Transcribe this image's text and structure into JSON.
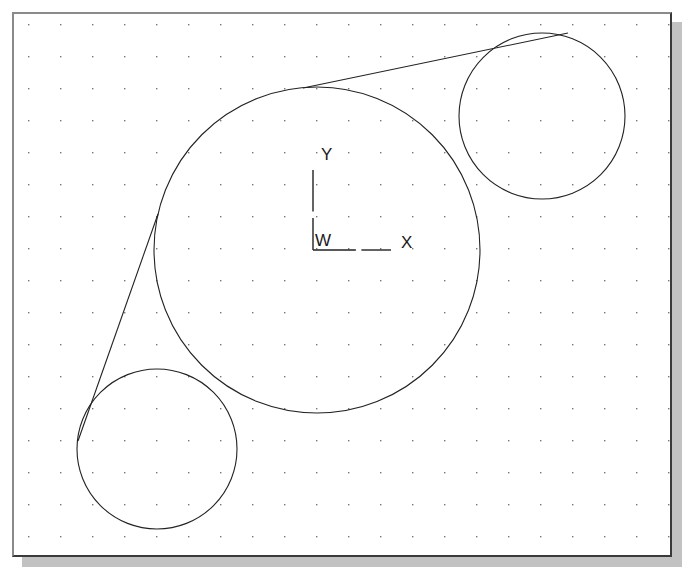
{
  "window": {
    "title": "CAD Drawing Area",
    "background_color": "#ffffff",
    "frame_color": "#3a3a3a",
    "shadow_color": "#9d9d9d"
  },
  "drawing": {
    "name": "tangent-circles-drawing",
    "line_color": "#222222",
    "grid": {
      "name": "dot-grid",
      "visible": true,
      "dot_color": "#777777",
      "spacing_px": 32,
      "origin_x_px": 28,
      "origin_y_px": 24
    },
    "ucs_icon": {
      "name": "ucs-icon",
      "origin_label": "W",
      "x_axis_label": "X",
      "y_axis_label": "Y",
      "origin_x_px": 313,
      "origin_y_px": 250,
      "x_axis_length_px": 78,
      "y_axis_length_px": 80
    },
    "entities": [
      {
        "name": "circle-large-center",
        "type": "circle",
        "cx": 317,
        "cy": 250,
        "r": 163
      },
      {
        "name": "circle-small-top-right",
        "type": "circle",
        "cx": 542,
        "cy": 116,
        "r": 83
      },
      {
        "name": "circle-small-bottom-left",
        "type": "circle",
        "cx": 157,
        "cy": 449,
        "r": 80
      },
      {
        "name": "tangent-line-upper",
        "type": "line",
        "x1": 303,
        "y1": 88,
        "x2": 568,
        "y2": 33
      },
      {
        "name": "tangent-line-lower",
        "type": "line",
        "x1": 158,
        "y1": 214,
        "x2": 78,
        "y2": 441
      }
    ]
  }
}
